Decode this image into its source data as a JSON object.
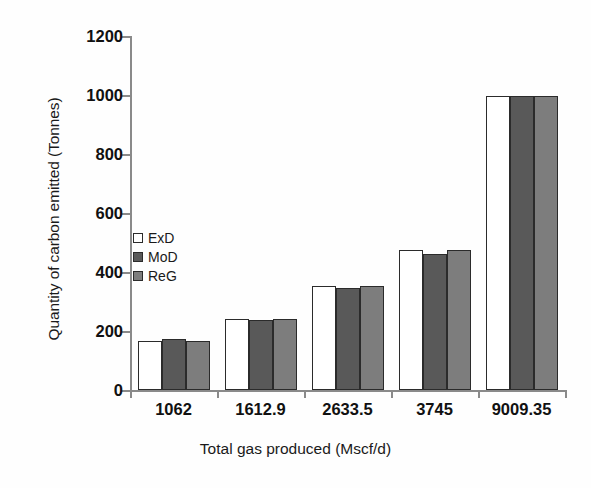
{
  "chart_data": {
    "type": "bar",
    "title": "",
    "xlabel": "Total gas produced (Mscf/d)",
    "ylabel": "Quantity of carbon emitted (Tonnes)",
    "categories": [
      "1062",
      "1612.9",
      "2633.5",
      "3745",
      "9009.35"
    ],
    "series": [
      {
        "name": "ExD",
        "color": "#ffffff",
        "values": [
          165,
          242,
          352,
          475,
          995
        ]
      },
      {
        "name": "MoD",
        "color": "#595959",
        "values": [
          172,
          237,
          347,
          461,
          995
        ]
      },
      {
        "name": "ReG",
        "color": "#7d7d7d",
        "values": [
          165,
          242,
          352,
          475,
          995
        ]
      }
    ],
    "ylim": [
      0,
      1200
    ],
    "yticks": [
      0,
      200,
      400,
      600,
      800,
      1000,
      1200
    ],
    "ytick_labels": [
      "0",
      "200",
      "400",
      "600",
      "800",
      "1000",
      "1200"
    ],
    "grid": false,
    "legend_position": "inside-left"
  },
  "legend": {
    "items": [
      {
        "label": "ExD",
        "color": "#ffffff"
      },
      {
        "label": "MoD",
        "color": "#595959"
      },
      {
        "label": "ReG",
        "color": "#7d7d7d"
      }
    ]
  },
  "axes": {
    "y_title": "Quantity of carbon emitted (Tonnes)",
    "x_title": "Total gas produced (Mscf/d)"
  }
}
